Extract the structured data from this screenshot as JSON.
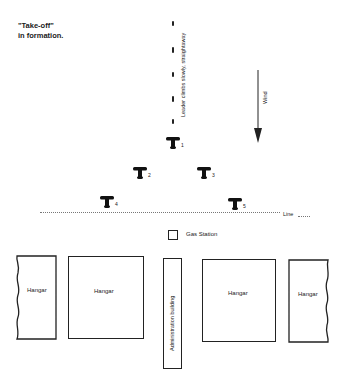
{
  "title": {
    "line1": "\"Take-off\"",
    "line2": "in formation."
  },
  "leader_note": "Leader climbs slowly, straightaway",
  "wind": {
    "label": "Wind",
    "icon": "arrow-down-icon"
  },
  "planes": [
    {
      "number": "1",
      "x": 165,
      "y": 136
    },
    {
      "number": "2",
      "x": 132,
      "y": 166
    },
    {
      "number": "3",
      "x": 196,
      "y": 166
    },
    {
      "number": "4",
      "x": 99,
      "y": 195
    },
    {
      "number": "5",
      "x": 227,
      "y": 197
    }
  ],
  "takeoff_line": {
    "label": "Line"
  },
  "gas_station": {
    "label": "Gas Station"
  },
  "buildings": [
    {
      "label": "Hangar",
      "type": "hangar-cut-left"
    },
    {
      "label": "Hangar",
      "type": "hangar"
    },
    {
      "label": "Administration building",
      "type": "admin"
    },
    {
      "label": "Hangar",
      "type": "hangar"
    },
    {
      "label": "Hangar",
      "type": "hangar-cut-right"
    }
  ],
  "colors": {
    "ink": "#1a1a1a",
    "background": "#ffffff"
  }
}
